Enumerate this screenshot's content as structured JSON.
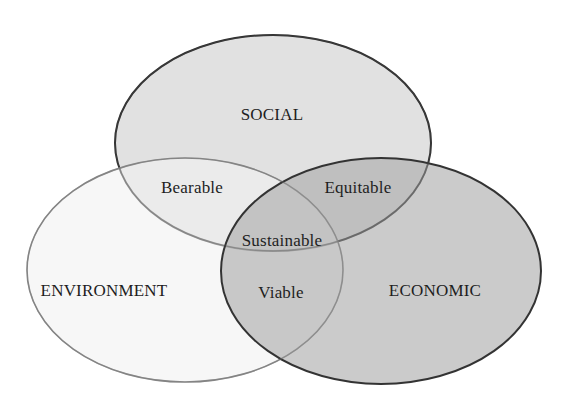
{
  "diagram": {
    "type": "venn",
    "sets": [
      {
        "id": "social",
        "label": "SOCIAL",
        "fill": "#dcdcdc",
        "stroke": "#2a2a2a"
      },
      {
        "id": "environment",
        "label": "ENVIRONMENT",
        "fill": "#efefef",
        "stroke": "#8c8c8c"
      },
      {
        "id": "economic",
        "label": "ECONOMIC",
        "fill": "#b9b9b9",
        "stroke": "#333333"
      }
    ],
    "intersections": {
      "social_environment": "Bearable",
      "social_economic": "Equitable",
      "environment_economic": "Viable",
      "all": "Sustainable"
    }
  }
}
